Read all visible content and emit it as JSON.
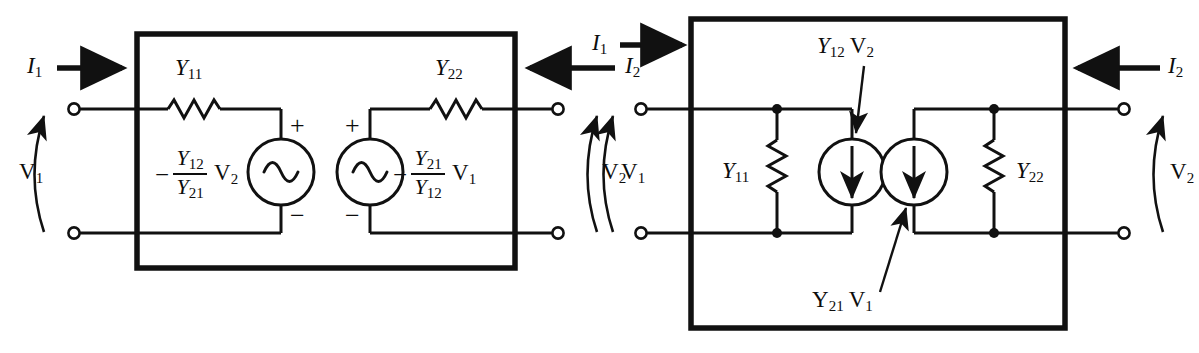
{
  "figure": {
    "stroke_color": "#111111",
    "background_color": "#ffffff"
  },
  "left_circuit": {
    "name": "series-voltage-source-equivalent",
    "port1_current": {
      "symbol": "I",
      "sub": "1",
      "direction": "right"
    },
    "port2_current": {
      "symbol": "I",
      "sub": "2",
      "direction": "left"
    },
    "port1_voltage": {
      "symbol": "V",
      "sub": "1"
    },
    "port2_voltage": {
      "symbol": "V",
      "sub": "2"
    },
    "element_1": {
      "symbol": "Y",
      "sub": "11",
      "type": "resistor"
    },
    "element_2": {
      "symbol": "Y",
      "sub": "22",
      "type": "resistor"
    },
    "source_1": {
      "type": "ac-voltage-source",
      "minus_sign": "−",
      "numerator": "Y",
      "numerator_sub": "12",
      "denominator": "Y",
      "denominator_sub": "21",
      "factor": "V",
      "factor_sub": "2",
      "plus_terminal": "+",
      "minus_terminal": "−"
    },
    "source_2": {
      "type": "ac-voltage-source",
      "minus_sign": "−",
      "numerator": "Y",
      "numerator_sub": "21",
      "denominator": "Y",
      "denominator_sub": "12",
      "factor": "V",
      "factor_sub": "1",
      "plus_terminal": "+",
      "minus_terminal": "−"
    }
  },
  "right_circuit": {
    "name": "shunt-current-source-equivalent",
    "port1_current": {
      "symbol": "I",
      "sub": "1",
      "direction": "right"
    },
    "port2_current": {
      "symbol": "I",
      "sub": "2",
      "direction": "left"
    },
    "port1_voltage": {
      "symbol": "V",
      "sub": "1"
    },
    "port2_voltage": {
      "symbol": "V",
      "sub": "2"
    },
    "element_1": {
      "symbol": "Y",
      "sub": "11",
      "type": "resistor"
    },
    "element_2": {
      "symbol": "Y",
      "sub": "22",
      "type": "resistor"
    },
    "source_1": {
      "type": "current-source",
      "symbol": "Y",
      "sub": "12",
      "factor": "V",
      "factor_sub": "2",
      "arrow_direction": "down"
    },
    "source_2": {
      "type": "current-source",
      "symbol": "Y",
      "sub": "21",
      "factor": "V",
      "factor_sub": "1",
      "arrow_direction": "down"
    }
  }
}
